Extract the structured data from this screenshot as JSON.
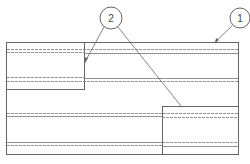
{
  "diagram": {
    "type": "patent-drawing",
    "colors": {
      "line": "#555555",
      "background": "#ffffff"
    },
    "callouts": [
      {
        "number": "1",
        "target": "outer-panel"
      },
      {
        "number": "2",
        "target": "offset-blocks"
      }
    ],
    "labels": {
      "callout_1": "1",
      "callout_2": "2"
    }
  }
}
